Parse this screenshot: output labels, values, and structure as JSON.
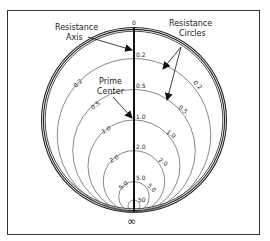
{
  "diagram": {
    "callouts": {
      "resistance_axis": [
        "Resistance",
        "Axis"
      ],
      "resistance_circles": [
        "Resistance",
        "Circles"
      ],
      "prime_center": [
        "Prime",
        "Center"
      ]
    },
    "axis_labels": [
      "0",
      "0.2",
      "0.5",
      "1.0",
      "2.0",
      "5.0",
      "50"
    ],
    "left_arc_labels": [
      "0.2",
      "0.5",
      "1.0",
      "2.0",
      "5.0"
    ],
    "right_arc_labels": [
      "0.2",
      "0.5",
      "1.0",
      "2.0",
      "5.0"
    ],
    "infinity_symbol": "∞",
    "resistance_values": [
      0,
      0.2,
      0.5,
      1.0,
      2.0,
      5.0,
      50
    ],
    "colors": {
      "line": "#222222",
      "thin_line": "#555555",
      "background": "#ffffff"
    }
  }
}
